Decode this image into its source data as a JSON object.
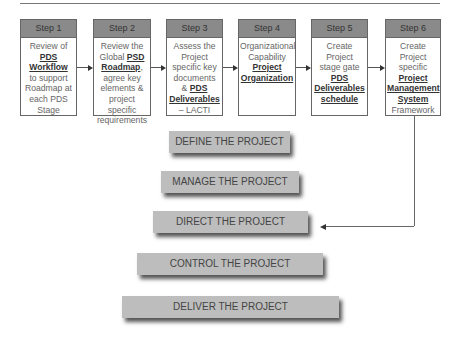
{
  "steps": [
    {
      "header": "Step 1",
      "body": [
        {
          "t": "Review of",
          "b": false
        },
        {
          "t": "PDS",
          "b": true
        },
        {
          "t": "Workflow",
          "b": true
        },
        {
          "t": "to support",
          "b": false
        },
        {
          "t": "Roadmap at",
          "b": false
        },
        {
          "t": "each PDS",
          "b": false
        },
        {
          "t": "Stage",
          "b": false
        }
      ]
    },
    {
      "header": "Step 2",
      "body": [
        {
          "t": "Review the",
          "b": false
        },
        {
          "t": "Global ",
          "b": false,
          "b2": "PSD"
        },
        {
          "t": "Roadmap",
          "b": true,
          "suffix": ","
        },
        {
          "t": "agree key",
          "b": false
        },
        {
          "t": "elements &",
          "b": false
        },
        {
          "t": "project specific",
          "b": false
        },
        {
          "t": "requirements",
          "b": false
        }
      ]
    },
    {
      "header": "Step 3",
      "body": [
        {
          "t": "Assess the",
          "b": false
        },
        {
          "t": "Project",
          "b": false
        },
        {
          "t": "specific key",
          "b": false
        },
        {
          "t": "documents",
          "b": false
        },
        {
          "t": "& ",
          "b": false,
          "b2": "PDS"
        },
        {
          "t": "Deliverables",
          "b": true
        },
        {
          "t": "– LACTI",
          "b": false
        }
      ]
    },
    {
      "header": "Step 4",
      "body": [
        {
          "t": "Organizational",
          "b": false
        },
        {
          "t": "Capability",
          "b": false
        },
        {
          "t": "Project",
          "b": true
        },
        {
          "t": "Organization",
          "b": true
        }
      ]
    },
    {
      "header": "Step 5",
      "body": [
        {
          "t": "Create Project",
          "b": false
        },
        {
          "t": "stage gate",
          "b": false
        },
        {
          "t": "PDS",
          "b": true
        },
        {
          "t": "Deliverables",
          "b": true
        },
        {
          "t": "schedule",
          "b": true
        }
      ]
    },
    {
      "header": "Step 6",
      "body": [
        {
          "t": "Create Project",
          "b": false
        },
        {
          "t": "specific",
          "b": false
        },
        {
          "t": "Project",
          "b": true
        },
        {
          "t": "Management",
          "b": true
        },
        {
          "t": "System",
          "b": true
        },
        {
          "t": "Framework",
          "b": false
        }
      ]
    }
  ],
  "bars": [
    {
      "label": "DEFINE THE PROJECT"
    },
    {
      "label": "MANAGE THE PROJECT"
    },
    {
      "label": "DIRECT THE PROJECT"
    },
    {
      "label": "CONTROL THE PROJECT"
    },
    {
      "label": "DELIVER THE PROJECT"
    }
  ]
}
